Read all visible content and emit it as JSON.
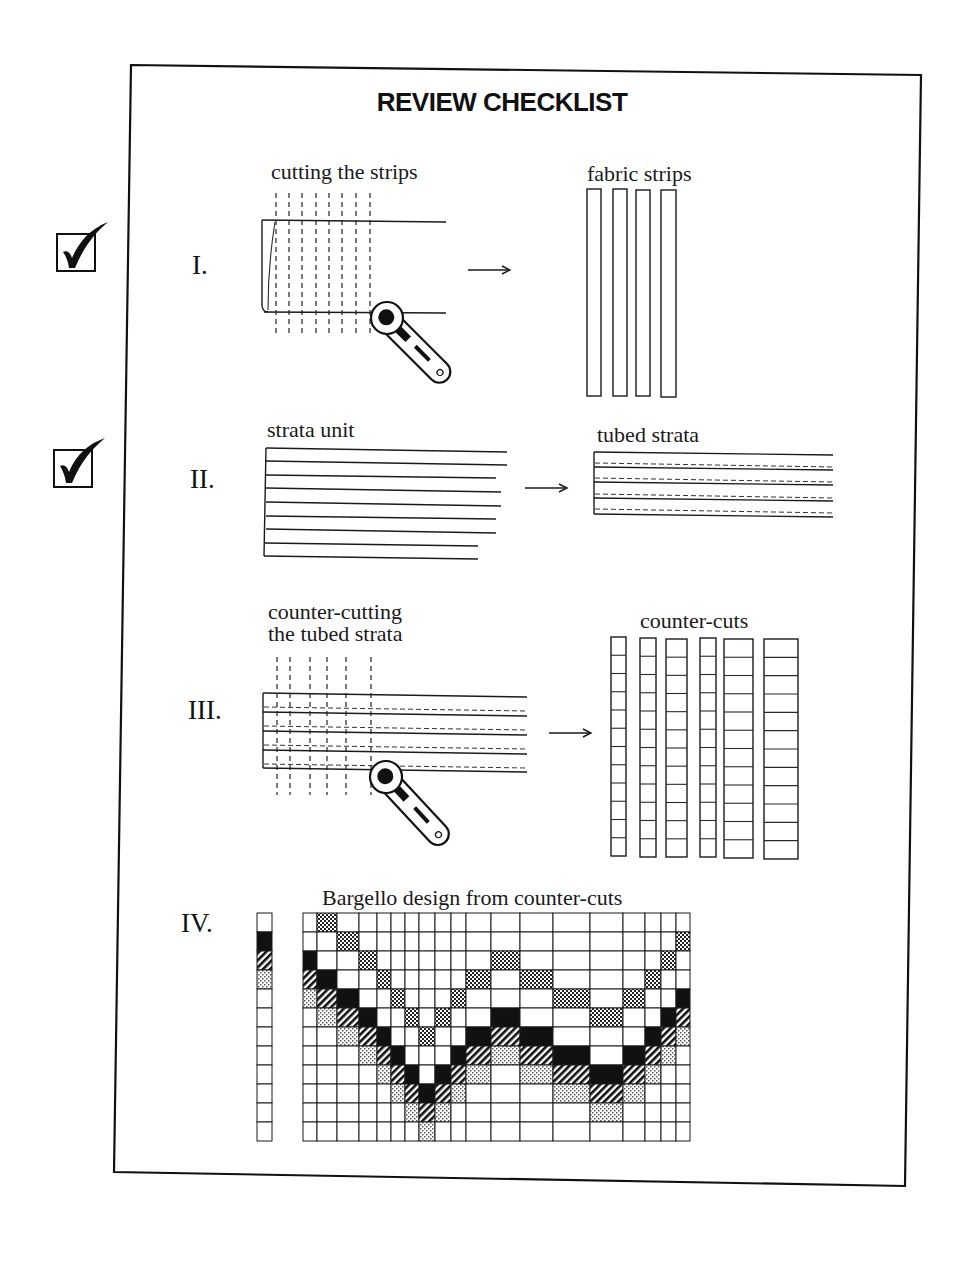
{
  "page": {
    "title": "REVIEW CHECKLIST",
    "colors": {
      "ink": "#1a1a1a",
      "paper": "#ffffff"
    }
  },
  "checkmarks": [
    {
      "id": "check-1",
      "state": "checked",
      "icon": "checkbox-checked-icon",
      "section": "I."
    },
    {
      "id": "check-2",
      "state": "checked",
      "icon": "checkbox-checked-icon",
      "section": "II."
    }
  ],
  "sections": [
    {
      "numeral": "I.",
      "left_caption": "cutting the strips",
      "right_caption": "fabric strips",
      "arrow": "→",
      "strips_count": 4,
      "icons": [
        "rotary-cutter-icon",
        "arrow-right-icon"
      ]
    },
    {
      "numeral": "II.",
      "left_caption": "strata unit",
      "right_caption": "tubed strata",
      "arrow": "→",
      "strata_lines": 9,
      "tube_seams": 4,
      "icons": [
        "arrow-right-icon"
      ]
    },
    {
      "numeral": "III.",
      "left_caption_line1": "counter-cutting",
      "left_caption_line2": "the tubed strata",
      "right_caption": "counter-cuts",
      "arrow": "→",
      "counter_cut_columns": 6,
      "icons": [
        "rotary-cutter-icon",
        "arrow-right-icon"
      ]
    },
    {
      "numeral": "IV.",
      "caption": "Bargello design from counter-cuts",
      "key_strip": [
        "white",
        "black",
        "hatch",
        "light-dots",
        "white",
        "white",
        "white",
        "white",
        "white",
        "white",
        "white",
        "white"
      ],
      "grid": {
        "rows": 12,
        "column_widths": [
          14,
          20,
          22,
          18,
          14,
          14,
          14,
          16,
          16,
          15,
          25,
          29,
          33,
          37,
          33,
          22,
          16,
          15,
          14
        ],
        "dark_dot_rows": [
          -1,
          0,
          1,
          2,
          3,
          4,
          5,
          6,
          5,
          4,
          3,
          2,
          3,
          4,
          5,
          4,
          3,
          2,
          1
        ],
        "legend": {
          "dark-dots": "dense checker",
          "black": "solid",
          "hatch": "diagonal stripes",
          "light-dots": "light checker",
          "white": "plain"
        }
      }
    }
  ]
}
